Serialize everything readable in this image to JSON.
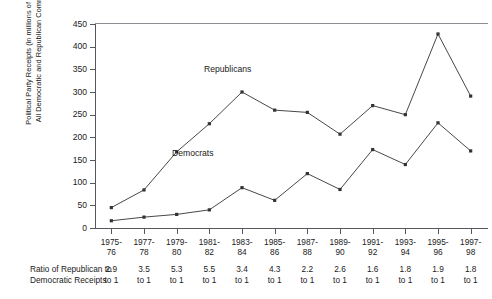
{
  "chart_data": {
    "type": "line",
    "title": "",
    "ylabel_line1": "Political Party Receipts (in millions of dollars)",
    "ylabel_line2": "All Democratic and Republican Committees",
    "xlabel": "",
    "ylim": [
      0,
      450
    ],
    "ytick_values": [
      450,
      400,
      350,
      300,
      250,
      200,
      150,
      100,
      50,
      0
    ],
    "ytick_labels": [
      "450",
      "400",
      "350",
      "300",
      "250",
      "200",
      "150",
      "100",
      "50",
      "0"
    ],
    "grid": false,
    "legend_position": "inline-annotations",
    "categories": [
      "1975-76",
      "1977-78",
      "1979-80",
      "1981-82",
      "1983-84",
      "1985-86",
      "1987-88",
      "1989-90",
      "1991-92",
      "1993-94",
      "1995-96",
      "1997-98"
    ],
    "category_lines": [
      [
        "1975-",
        "76"
      ],
      [
        "1977-",
        "78"
      ],
      [
        "1979-",
        "80"
      ],
      [
        "1981-",
        "82"
      ],
      [
        "1983-",
        "84"
      ],
      [
        "1985-",
        "86"
      ],
      [
        "1987-",
        "88"
      ],
      [
        "1989-",
        "90"
      ],
      [
        "1991-",
        "92"
      ],
      [
        "1993-",
        "94"
      ],
      [
        "1995-",
        "96"
      ],
      [
        "1997-",
        "98"
      ]
    ],
    "series": [
      {
        "name": "Republicans",
        "color": "#333333",
        "values": [
          45,
          84,
          168,
          230,
          300,
          260,
          255,
          207,
          270,
          250,
          428,
          291
        ]
      },
      {
        "name": "Democrats",
        "color": "#333333",
        "values": [
          16,
          24,
          30,
          40,
          89,
          61,
          120,
          85,
          173,
          140,
          232,
          170
        ]
      }
    ],
    "annotations": [
      {
        "text": "Republicans"
      },
      {
        "text": "Democrats"
      }
    ]
  },
  "ratio_table": {
    "caption_line1": "Ratio of Republican to",
    "caption_line2": "Democratic Receipts",
    "unit_suffix": "to 1",
    "values": [
      "2.9",
      "3.5",
      "5.3",
      "5.5",
      "3.4",
      "4.3",
      "2.2",
      "2.6",
      "1.6",
      "1.8",
      "1.9",
      "1.8"
    ]
  }
}
